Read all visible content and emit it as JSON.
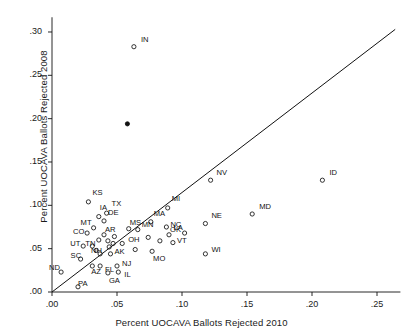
{
  "chart_data": {
    "type": "scatter",
    "title": "",
    "xlabel": "Percent UOCAVA Ballots Rejected 2010",
    "ylabel": "Percent UOCAVA Ballots Rejected 2008",
    "xlim": [
      0.0,
      0.268
    ],
    "ylim": [
      0.0,
      0.317
    ],
    "xticks": [
      0.0,
      0.05,
      0.1,
      0.15,
      0.2,
      0.25
    ],
    "xtick_labels": [
      ".00",
      ".05",
      ".10",
      ".15",
      ".20",
      ".25"
    ],
    "yticks": [
      0.0,
      0.05,
      0.1,
      0.15,
      0.2,
      0.25,
      0.3
    ],
    "ytick_labels": [
      ".00",
      ".05",
      ".10",
      ".15",
      ".20",
      ".25",
      ".30"
    ],
    "grid": false,
    "legend": null,
    "marker": "open-circle",
    "marker_color": "#111111",
    "reference_line": {
      "name": "45-degree-line",
      "type": "identity",
      "from": [
        0.0,
        0.0
      ],
      "to": [
        0.264,
        0.303
      ],
      "color": "#111111"
    },
    "points": [
      {
        "label": "IN",
        "x": 0.063,
        "y": 0.283,
        "lx": 7,
        "ly": -7
      },
      {
        "label": "",
        "x": 0.058,
        "y": 0.194,
        "lx": 0,
        "ly": 0,
        "filled": true
      },
      {
        "label": "ID",
        "x": 0.208,
        "y": 0.129,
        "lx": 7,
        "ly": -7
      },
      {
        "label": "NV",
        "x": 0.122,
        "y": 0.129,
        "lx": 6,
        "ly": -7
      },
      {
        "label": "KS",
        "x": 0.028,
        "y": 0.104,
        "lx": 4,
        "ly": -9
      },
      {
        "label": "MI",
        "x": 0.089,
        "y": 0.097,
        "lx": 4,
        "ly": -9
      },
      {
        "label": "MD",
        "x": 0.154,
        "y": 0.09,
        "lx": 7,
        "ly": -7
      },
      {
        "label": "TX",
        "x": 0.042,
        "y": 0.091,
        "lx": 5,
        "ly": -9
      },
      {
        "label": "IA",
        "x": 0.036,
        "y": 0.087,
        "lx": 1,
        "ly": -9
      },
      {
        "label": "DE",
        "x": 0.04,
        "y": 0.082,
        "lx": 4,
        "ly": -8
      },
      {
        "label": "NE",
        "x": 0.118,
        "y": 0.079,
        "lx": 6,
        "ly": -8
      },
      {
        "label": "MA",
        "x": 0.076,
        "y": 0.081,
        "lx": 3,
        "ly": -8
      },
      {
        "label": "NC",
        "x": 0.088,
        "y": 0.075,
        "lx": 4,
        "ly": -2
      },
      {
        "label": "MT",
        "x": 0.032,
        "y": 0.074,
        "lx": -13,
        "ly": -5
      },
      {
        "label": "MS",
        "x": 0.059,
        "y": 0.073,
        "lx": 1,
        "ly": -6
      },
      {
        "label": "MN",
        "x": 0.066,
        "y": 0.072,
        "lx": 4,
        "ly": -5
      },
      {
        "label": "CO",
        "x": 0.027,
        "y": 0.068,
        "lx": -14,
        "ly": -1
      },
      {
        "label": "AR",
        "x": 0.04,
        "y": 0.066,
        "lx": 1,
        "ly": -5
      },
      {
        "label": "LA",
        "x": 0.102,
        "y": 0.068,
        "lx": -11,
        "ly": -5
      },
      {
        "label": "OK",
        "x": 0.09,
        "y": 0.066,
        "lx": 1,
        "ly": -5
      },
      {
        "label": "MN2",
        "x": 0.074,
        "y": 0.063,
        "lx": 0,
        "ly": 0,
        "hide_label": true
      },
      {
        "label": "VT",
        "x": 0.093,
        "y": 0.057,
        "lx": 4,
        "ly": -2
      },
      {
        "label": "OH",
        "x": 0.054,
        "y": 0.056,
        "lx": 6,
        "ly": -4
      },
      {
        "label": "UT",
        "x": 0.024,
        "y": 0.053,
        "lx": -13,
        "ly": -2
      },
      {
        "label": "TN",
        "x": 0.031,
        "y": 0.053,
        "lx": -7,
        "ly": -2
      },
      {
        "label": "",
        "x": 0.083,
        "y": 0.059,
        "lx": 0,
        "ly": 0
      },
      {
        "label": "NH",
        "x": 0.037,
        "y": 0.044,
        "lx": -9,
        "ly": -3
      },
      {
        "label": "AK",
        "x": 0.045,
        "y": 0.044,
        "lx": 4,
        "ly": -2
      },
      {
        "label": "MO",
        "x": 0.077,
        "y": 0.047,
        "lx": 1,
        "ly": 8
      },
      {
        "label": "WI",
        "x": 0.118,
        "y": 0.044,
        "lx": 6,
        "ly": -4
      },
      {
        "label": "SC",
        "x": 0.022,
        "y": 0.038,
        "lx": -10,
        "ly": -3
      },
      {
        "label": "ND",
        "x": 0.007,
        "y": 0.023,
        "lx": -12,
        "ly": -4
      },
      {
        "label": "AZ",
        "x": 0.031,
        "y": 0.03,
        "lx": -1,
        "ly": 6
      },
      {
        "label": "FL",
        "x": 0.037,
        "y": 0.03,
        "lx": 5,
        "ly": 4
      },
      {
        "label": "NJ",
        "x": 0.05,
        "y": 0.03,
        "lx": 5,
        "ly": -2
      },
      {
        "label": "IL",
        "x": 0.051,
        "y": 0.023,
        "lx": 6,
        "ly": 3
      },
      {
        "label": "GA",
        "x": 0.043,
        "y": 0.022,
        "lx": 1,
        "ly": 8
      },
      {
        "label": "PA",
        "x": 0.02,
        "y": 0.006,
        "lx": 0,
        "ly": -3
      },
      {
        "label": "",
        "x": 0.034,
        "y": 0.048,
        "lx": 0,
        "ly": 0
      },
      {
        "label": "",
        "x": 0.044,
        "y": 0.052,
        "lx": 0,
        "ly": 0
      },
      {
        "label": "",
        "x": 0.047,
        "y": 0.056,
        "lx": 0,
        "ly": 0
      },
      {
        "label": "",
        "x": 0.043,
        "y": 0.059,
        "lx": 0,
        "ly": 0
      },
      {
        "label": "",
        "x": 0.036,
        "y": 0.06,
        "lx": 0,
        "ly": 0
      },
      {
        "label": "",
        "x": 0.048,
        "y": 0.064,
        "lx": 0,
        "ly": 0
      },
      {
        "label": "",
        "x": 0.064,
        "y": 0.049,
        "lx": 0,
        "ly": 0
      }
    ]
  },
  "axis": {
    "x_title": "Percent UOCAVA Ballots Rejected 2010",
    "y_title": "Percent UOCAVA Ballots Rejected 2008"
  }
}
